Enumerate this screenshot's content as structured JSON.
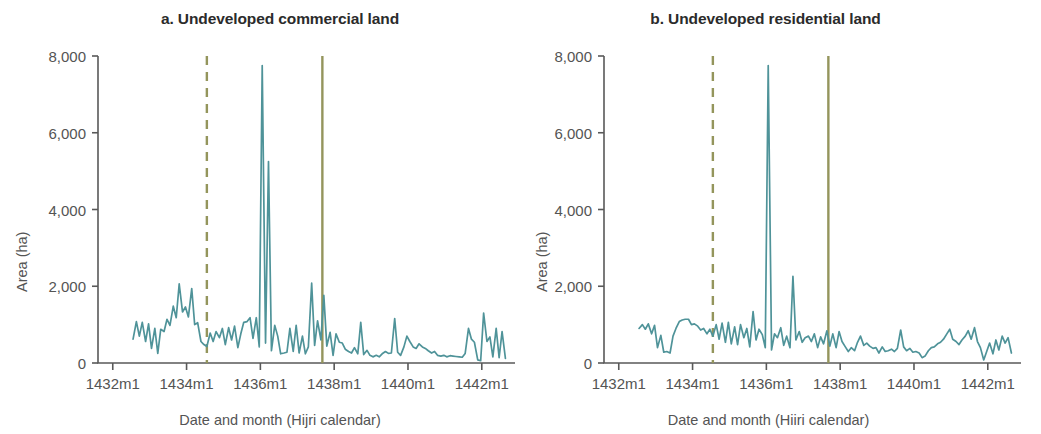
{
  "figure": {
    "background": "#ffffff",
    "series_color": "#4f9399",
    "reference_line_color": "#94955c",
    "axis_color": "#595959",
    "text_color": "#545454",
    "title_color": "#2b2b2b"
  },
  "panels": [
    {
      "key": "a",
      "title": "a. Undeveloped commercial land",
      "ylabel": "Area (ha)",
      "xlabel": "Date and month (Hijri calendar)"
    },
    {
      "key": "b",
      "title": "b. Undeveloped residential land",
      "ylabel": "Area (ha)",
      "xlabel": "Date and month (Hiiri calendar)"
    }
  ],
  "axes": {
    "y_ticks": [
      0,
      2000,
      4000,
      6000,
      8000
    ],
    "y_tick_labels": [
      "0",
      "2,000",
      "4,000",
      "6,000",
      "8,000"
    ],
    "x_ticks": [
      1432,
      1434,
      1436,
      1438,
      1440,
      1442
    ],
    "x_tick_labels": [
      "1432m1",
      "1434m1",
      "1436m1",
      "1438m1",
      "1440m1",
      "1442m1"
    ],
    "ylim": [
      0,
      8000
    ],
    "xlim": [
      1431.6,
      1442.9
    ],
    "grid": false,
    "legend": null
  },
  "chart_data": {
    "type": "line",
    "xlabel": "Date and month (Hijri calendar)",
    "ylabel": "Area (ha)",
    "xlim": [
      1431.6,
      1442.9
    ],
    "ylim": [
      0,
      8000
    ],
    "x_tick_labels": [
      "1432m1",
      "1434m1",
      "1436m1",
      "1438m1",
      "1440m1",
      "1442m1"
    ],
    "x_ticks": [
      1432,
      1434,
      1436,
      1438,
      1440,
      1442
    ],
    "y_ticks": [
      0,
      2000,
      4000,
      6000,
      8000
    ],
    "grid": false,
    "legend_position": "none",
    "annotations": [
      {
        "type": "vline",
        "style": "dashed",
        "x": 1434.55,
        "color": "#94955c",
        "panel": "a"
      },
      {
        "type": "vline",
        "style": "solid",
        "x": 1437.68,
        "color": "#94955c",
        "panel": "a"
      },
      {
        "type": "vline",
        "style": "dashed",
        "x": 1434.55,
        "color": "#94955c",
        "panel": "b"
      },
      {
        "type": "vline",
        "style": "solid",
        "x": 1437.68,
        "color": "#94955c",
        "panel": "b"
      }
    ],
    "series": [
      {
        "name": "Undeveloped commercial land",
        "panel": "a",
        "color": "#4f9399",
        "x": [
          1432.55,
          1432.64,
          1432.72,
          1432.8,
          1432.89,
          1432.97,
          1433.05,
          1433.14,
          1433.22,
          1433.3,
          1433.39,
          1433.47,
          1433.55,
          1433.64,
          1433.72,
          1433.8,
          1433.89,
          1433.97,
          1434.05,
          1434.14,
          1434.22,
          1434.3,
          1434.39,
          1434.47,
          1434.55,
          1434.64,
          1434.72,
          1434.8,
          1434.89,
          1434.97,
          1435.05,
          1435.14,
          1435.22,
          1435.3,
          1435.39,
          1435.47,
          1435.55,
          1435.64,
          1435.72,
          1435.8,
          1435.89,
          1435.97,
          1436.05,
          1436.14,
          1436.22,
          1436.3,
          1436.39,
          1436.47,
          1436.55,
          1436.64,
          1436.72,
          1436.8,
          1436.89,
          1436.97,
          1437.05,
          1437.14,
          1437.22,
          1437.3,
          1437.39,
          1437.47,
          1437.55,
          1437.64,
          1437.72,
          1437.8,
          1437.89,
          1437.97,
          1438.05,
          1438.14,
          1438.22,
          1438.3,
          1438.39,
          1438.47,
          1438.55,
          1438.64,
          1438.72,
          1438.8,
          1438.89,
          1438.97,
          1439.05,
          1439.14,
          1439.22,
          1439.3,
          1439.39,
          1439.47,
          1439.55,
          1439.64,
          1439.72,
          1439.8,
          1439.89,
          1439.97,
          1440.05,
          1440.14,
          1440.22,
          1440.3,
          1440.39,
          1440.47,
          1440.55,
          1440.64,
          1440.72,
          1440.8,
          1440.89,
          1440.97,
          1441.05,
          1441.14,
          1441.22,
          1441.3,
          1441.39,
          1441.47,
          1441.55,
          1441.64,
          1441.72,
          1441.8,
          1441.89,
          1441.97,
          1442.05,
          1442.14,
          1442.22,
          1442.3,
          1442.39,
          1442.47,
          1442.55,
          1442.64
        ],
        "values": [
          620,
          1080,
          700,
          1060,
          560,
          1020,
          380,
          900,
          250,
          880,
          820,
          1140,
          980,
          1480,
          1180,
          2060,
          1330,
          1460,
          1200,
          1940,
          1000,
          1050,
          560,
          480,
          430,
          780,
          560,
          820,
          660,
          900,
          480,
          920,
          600,
          960,
          400,
          760,
          1060,
          1080,
          1180,
          640,
          1180,
          420,
          7750,
          520,
          5250,
          320,
          980,
          700,
          240,
          260,
          280,
          900,
          300,
          980,
          260,
          700,
          240,
          420,
          2080,
          460,
          1100,
          600,
          1760,
          440,
          800,
          200,
          760,
          540,
          520,
          360,
          300,
          260,
          400,
          240,
          1060,
          220,
          330,
          200,
          160,
          200,
          160,
          240,
          300,
          250,
          260,
          1160,
          280,
          200,
          420,
          700,
          560,
          420,
          380,
          500,
          420,
          380,
          320,
          260,
          300,
          200,
          180,
          200,
          160,
          190,
          180,
          170,
          160,
          150,
          250,
          900,
          620,
          540,
          80,
          60,
          1300,
          560,
          680,
          160,
          900,
          140,
          820,
          120
        ]
      },
      {
        "name": "Undeveloped residential land",
        "panel": "b",
        "color": "#4f9399",
        "x": [
          1432.55,
          1432.64,
          1432.72,
          1432.8,
          1432.89,
          1432.97,
          1433.05,
          1433.14,
          1433.22,
          1433.3,
          1433.39,
          1433.47,
          1433.55,
          1433.64,
          1433.72,
          1433.8,
          1433.89,
          1433.97,
          1434.05,
          1434.14,
          1434.22,
          1434.3,
          1434.39,
          1434.47,
          1434.55,
          1434.64,
          1434.72,
          1434.8,
          1434.89,
          1434.97,
          1435.05,
          1435.14,
          1435.22,
          1435.3,
          1435.39,
          1435.47,
          1435.55,
          1435.64,
          1435.72,
          1435.8,
          1435.89,
          1435.97,
          1436.05,
          1436.14,
          1436.22,
          1436.3,
          1436.39,
          1436.47,
          1436.55,
          1436.64,
          1436.72,
          1436.8,
          1436.89,
          1436.97,
          1437.05,
          1437.14,
          1437.22,
          1437.3,
          1437.39,
          1437.47,
          1437.55,
          1437.64,
          1437.72,
          1437.8,
          1437.89,
          1437.97,
          1438.05,
          1438.14,
          1438.22,
          1438.3,
          1438.39,
          1438.47,
          1438.55,
          1438.64,
          1438.72,
          1438.8,
          1438.89,
          1438.97,
          1439.05,
          1439.14,
          1439.22,
          1439.3,
          1439.39,
          1439.47,
          1439.55,
          1439.64,
          1439.72,
          1439.8,
          1439.89,
          1439.97,
          1440.05,
          1440.14,
          1440.22,
          1440.3,
          1440.39,
          1440.47,
          1440.55,
          1440.64,
          1440.72,
          1440.8,
          1440.89,
          1440.97,
          1441.05,
          1441.14,
          1441.22,
          1441.3,
          1441.39,
          1441.47,
          1441.55,
          1441.64,
          1441.72,
          1441.8,
          1441.89,
          1441.97,
          1442.05,
          1442.14,
          1442.22,
          1442.3,
          1442.39,
          1442.47,
          1442.55,
          1442.64
        ],
        "values": [
          900,
          1000,
          880,
          1020,
          760,
          980,
          400,
          720,
          280,
          300,
          260,
          700,
          900,
          1080,
          1120,
          1140,
          1140,
          1000,
          1020,
          960,
          860,
          900,
          760,
          880,
          700,
          1000,
          620,
          1040,
          540,
          1060,
          500,
          940,
          480,
          1000,
          660,
          900,
          420,
          1340,
          600,
          880,
          740,
          400,
          7750,
          340,
          760,
          660,
          920,
          460,
          700,
          400,
          2260,
          600,
          820,
          540,
          660,
          700,
          560,
          760,
          400,
          680,
          500,
          840,
          440,
          760,
          400,
          820,
          560,
          420,
          300,
          400,
          320,
          540,
          700,
          460,
          520,
          440,
          380,
          400,
          260,
          420,
          300,
          320,
          360,
          300,
          380,
          860,
          420,
          320,
          380,
          280,
          300,
          260,
          140,
          180,
          320,
          400,
          420,
          500,
          540,
          620,
          760,
          880,
          620,
          560,
          480,
          600,
          700,
          840,
          620,
          920,
          560,
          400,
          80,
          300,
          520,
          240,
          600,
          340,
          700,
          520,
          660,
          260
        ]
      }
    ]
  }
}
